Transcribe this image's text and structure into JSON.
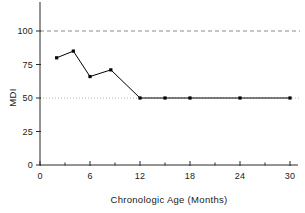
{
  "chart_data": {
    "type": "line",
    "title": "",
    "xlabel": "Chronologic Age (Months)",
    "ylabel": "MDI",
    "xlim": [
      0,
      30
    ],
    "ylim": [
      0,
      112
    ],
    "xticks": [
      0,
      6,
      12,
      18,
      24,
      30
    ],
    "xtick_labels": [
      "0",
      "6",
      "12",
      "18",
      "24",
      "30"
    ],
    "xminor_ticks": [
      3,
      9,
      15,
      21,
      27
    ],
    "yticks": [
      0,
      25,
      50,
      75,
      100
    ],
    "ytick_labels": [
      "0",
      "25",
      "50",
      "75",
      "100"
    ],
    "grid": false,
    "legend": "none",
    "series": [
      {
        "name": "MDI",
        "marker": "square",
        "color": "#000000",
        "x": [
          2,
          4,
          6,
          8.5,
          12,
          15,
          18,
          24,
          30
        ],
        "values": [
          80,
          85,
          66,
          71,
          50,
          50,
          50,
          50,
          50
        ]
      }
    ],
    "reference_lines": [
      {
        "name": "normal-reference",
        "axis": "y",
        "value": 100,
        "style": "dashed",
        "color": "#8a8a8a"
      },
      {
        "name": "floor-reference",
        "axis": "y",
        "value": 50,
        "style": "dotted",
        "color": "#b4b4b4"
      }
    ]
  },
  "colors": {
    "axis": "#2b2b2b",
    "series": "#000000",
    "dashed_reference": "#8a8a8a",
    "dotted_reference": "#b4b4b4",
    "background": "#ffffff"
  }
}
